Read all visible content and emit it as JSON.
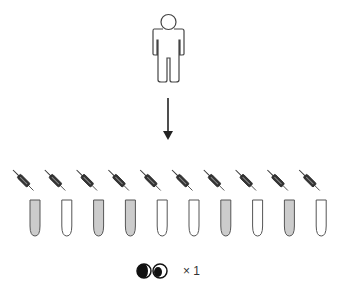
{
  "diagram": {
    "person": {
      "icon": "person-outline-icon"
    },
    "arrow": {
      "icon": "down-arrow-icon"
    },
    "syringes": {
      "count": 10,
      "icon": "syringe-icon"
    },
    "tubes": [
      {
        "filled": true
      },
      {
        "filled": false
      },
      {
        "filled": true
      },
      {
        "filled": true
      },
      {
        "filled": false
      },
      {
        "filled": false
      },
      {
        "filled": true
      },
      {
        "filled": false
      },
      {
        "filled": true
      },
      {
        "filled": false
      }
    ],
    "eyes": {
      "icon": "eyes-icon",
      "multiplier_label": "× 1"
    },
    "colors": {
      "stroke": "#333333",
      "tube_fill": "#cccccc",
      "empty_fill": "#ffffff"
    }
  }
}
